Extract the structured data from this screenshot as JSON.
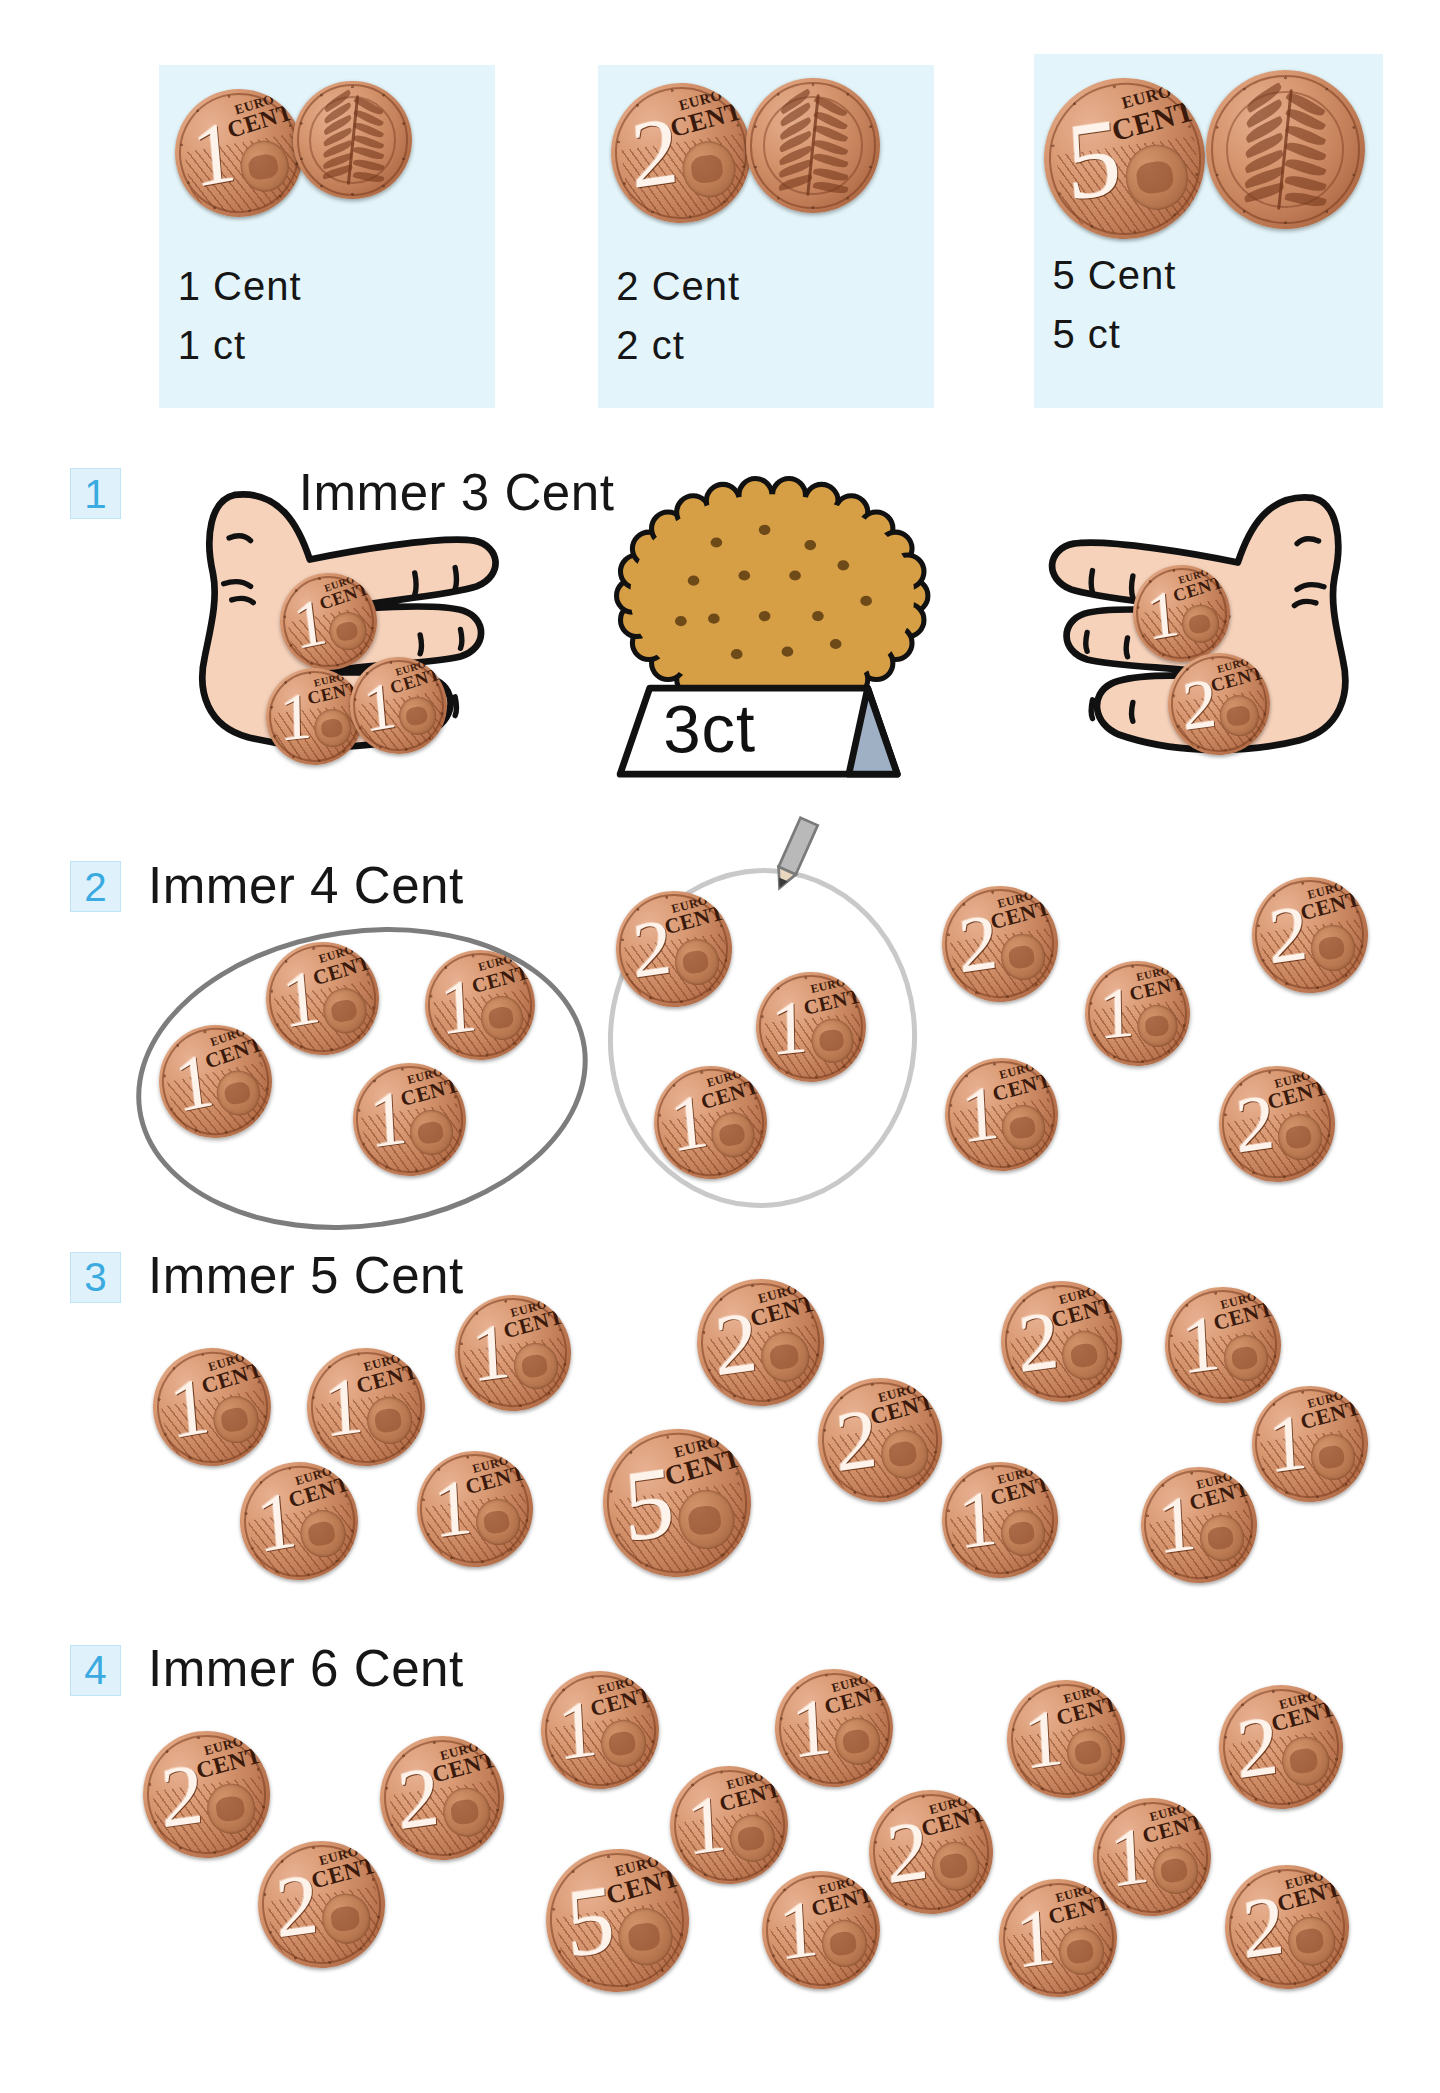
{
  "worksheet": {
    "language": "de",
    "background": "#ffffff",
    "panel_bg": "#e3f5fa",
    "badge_bg": "#dff2fb",
    "badge_border": "#bfe4f3",
    "badge_color": "#3aaae0",
    "text_color": "#161616",
    "coin_copper": "#c27e58",
    "hand_skin": "#f6d2bb",
    "biscuit_color": "#d79f45",
    "ellipse_dark": "#7d7d7d",
    "ellipse_light": "#c9c9c9"
  },
  "header": {
    "panels": [
      {
        "id": "panel-1-cent",
        "x": 118,
        "y": 48,
        "w": 250,
        "h": 255,
        "line1": "1 Cent",
        "line2": "1 ct",
        "value": 1,
        "coins": [
          {
            "value": 1,
            "side": "obverse",
            "x": 12,
            "y": 18,
            "size": 95,
            "rot": -10
          },
          {
            "value": 1,
            "side": "reverse",
            "x": 100,
            "y": 12,
            "size": 88,
            "rot": 0
          }
        ]
      },
      {
        "id": "panel-2-cent",
        "x": 444,
        "y": 48,
        "w": 250,
        "h": 255,
        "line1": "2 Cent",
        "line2": "2 ct",
        "value": 2,
        "coins": [
          {
            "value": 2,
            "side": "obverse",
            "x": 10,
            "y": 14,
            "size": 104,
            "rot": -8
          },
          {
            "value": 2,
            "side": "reverse",
            "x": 110,
            "y": 10,
            "size": 100,
            "rot": 0
          }
        ]
      },
      {
        "id": "panel-5-cent",
        "x": 768,
        "y": 40,
        "w": 260,
        "h": 263,
        "line1": "5 Cent",
        "line2": "5 ct",
        "value": 5,
        "coins": [
          {
            "value": 5,
            "side": "obverse",
            "x": 8,
            "y": 18,
            "size": 120,
            "rot": -8
          },
          {
            "value": 5,
            "side": "reverse",
            "x": 128,
            "y": 12,
            "size": 118,
            "rot": 0
          }
        ]
      }
    ]
  },
  "exercises": [
    {
      "number": "1",
      "title": "Immer 3 Cent",
      "badge": {
        "x": 52,
        "y": 348
      },
      "title_pos": {
        "x": 222,
        "y": 348
      },
      "price_sign": {
        "text": "3ct",
        "x": 455,
        "y": 505,
        "w": 215,
        "h": 75
      },
      "biscuit": {
        "x": 452,
        "y": 352,
        "w": 245,
        "h": 165
      },
      "hands": [
        {
          "id": "hand-left",
          "x": 112,
          "y": 348,
          "w": 320,
          "h": 235,
          "flip": false,
          "coins": [
            {
              "value": 1,
              "side": "obverse",
              "x": 96,
              "y": 78,
              "size": 72,
              "rot": -12
            },
            {
              "value": 1,
              "side": "obverse",
              "x": 86,
              "y": 148,
              "size": 72,
              "rot": -6
            },
            {
              "value": 1,
              "side": "obverse",
              "x": 148,
              "y": 140,
              "size": 72,
              "rot": -10
            }
          ]
        },
        {
          "id": "hand-right",
          "x": 718,
          "y": 350,
          "w": 320,
          "h": 235,
          "flip": true,
          "coins": [
            {
              "value": 1,
              "side": "obverse",
              "x": 124,
              "y": 70,
              "size": 72,
              "rot": -10
            },
            {
              "value": 2,
              "side": "obverse",
              "x": 150,
              "y": 135,
              "size": 76,
              "rot": -8
            }
          ]
        }
      ],
      "coins": []
    },
    {
      "number": "2",
      "title": "Immer 4 Cent",
      "badge": {
        "x": 52,
        "y": 640
      },
      "title_pos": {
        "x": 110,
        "y": 640
      },
      "groups": [
        {
          "id": "group-solved-dark",
          "x": 100,
          "y": 690,
          "w": 330,
          "h": 215,
          "color": "#7d7d7d",
          "width": 4,
          "rot": -8
        },
        {
          "id": "group-solved-light",
          "x": 452,
          "y": 645,
          "w": 222,
          "h": 245,
          "color": "#c9c9c9",
          "width": 4,
          "rot": 4
        }
      ],
      "pencil": {
        "x": 566,
        "y": 604,
        "w": 48,
        "h": 62
      },
      "coins": [
        {
          "value": 1,
          "side": "obverse",
          "x": 198,
          "y": 700,
          "size": 84,
          "rot": -10
        },
        {
          "value": 1,
          "side": "obverse",
          "x": 316,
          "y": 706,
          "size": 82,
          "rot": -8
        },
        {
          "value": 1,
          "side": "obverse",
          "x": 118,
          "y": 762,
          "size": 84,
          "rot": -12
        },
        {
          "value": 1,
          "side": "obverse",
          "x": 262,
          "y": 790,
          "size": 84,
          "rot": -8
        },
        {
          "value": 2,
          "side": "obverse",
          "x": 458,
          "y": 662,
          "size": 86,
          "rot": -8
        },
        {
          "value": 1,
          "side": "obverse",
          "x": 562,
          "y": 722,
          "size": 82,
          "rot": -6
        },
        {
          "value": 1,
          "side": "obverse",
          "x": 486,
          "y": 792,
          "size": 84,
          "rot": -10
        },
        {
          "value": 2,
          "side": "obverse",
          "x": 700,
          "y": 658,
          "size": 86,
          "rot": -8
        },
        {
          "value": 1,
          "side": "obverse",
          "x": 806,
          "y": 714,
          "size": 78,
          "rot": -6
        },
        {
          "value": 1,
          "side": "obverse",
          "x": 702,
          "y": 786,
          "size": 84,
          "rot": -8
        },
        {
          "value": 2,
          "side": "obverse",
          "x": 930,
          "y": 652,
          "size": 86,
          "rot": -8
        },
        {
          "value": 2,
          "side": "obverse",
          "x": 906,
          "y": 792,
          "size": 86,
          "rot": -8
        }
      ]
    },
    {
      "number": "3",
      "title": "Immer 5 Cent",
      "badge": {
        "x": 52,
        "y": 930
      },
      "title_pos": {
        "x": 110,
        "y": 930
      },
      "groups": [],
      "coins": [
        {
          "value": 1,
          "side": "obverse",
          "x": 114,
          "y": 1002,
          "size": 88,
          "rot": -10
        },
        {
          "value": 1,
          "side": "obverse",
          "x": 228,
          "y": 1002,
          "size": 88,
          "rot": -8
        },
        {
          "value": 1,
          "side": "obverse",
          "x": 338,
          "y": 962,
          "size": 86,
          "rot": -8
        },
        {
          "value": 1,
          "side": "obverse",
          "x": 178,
          "y": 1086,
          "size": 88,
          "rot": -10
        },
        {
          "value": 1,
          "side": "obverse",
          "x": 310,
          "y": 1078,
          "size": 86,
          "rot": -8
        },
        {
          "value": 5,
          "side": "obverse",
          "x": 448,
          "y": 1062,
          "size": 110,
          "rot": -8
        },
        {
          "value": 2,
          "side": "obverse",
          "x": 518,
          "y": 950,
          "size": 94,
          "rot": -8
        },
        {
          "value": 2,
          "side": "obverse",
          "x": 608,
          "y": 1024,
          "size": 92,
          "rot": -8
        },
        {
          "value": 2,
          "side": "obverse",
          "x": 744,
          "y": 952,
          "size": 90,
          "rot": -8
        },
        {
          "value": 1,
          "side": "obverse",
          "x": 866,
          "y": 956,
          "size": 86,
          "rot": -8
        },
        {
          "value": 1,
          "side": "obverse",
          "x": 700,
          "y": 1086,
          "size": 86,
          "rot": -8
        },
        {
          "value": 1,
          "side": "obverse",
          "x": 848,
          "y": 1090,
          "size": 86,
          "rot": -8
        },
        {
          "value": 1,
          "side": "obverse",
          "x": 930,
          "y": 1030,
          "size": 86,
          "rot": -8
        }
      ]
    },
    {
      "number": "4",
      "title": "Immer 6 Cent",
      "badge": {
        "x": 52,
        "y": 1222
      },
      "title_pos": {
        "x": 110,
        "y": 1222
      },
      "groups": [],
      "coins": [
        {
          "value": 2,
          "side": "obverse",
          "x": 106,
          "y": 1286,
          "size": 94,
          "rot": -8
        },
        {
          "value": 2,
          "side": "obverse",
          "x": 282,
          "y": 1290,
          "size": 92,
          "rot": -8
        },
        {
          "value": 2,
          "side": "obverse",
          "x": 192,
          "y": 1368,
          "size": 94,
          "rot": -8
        },
        {
          "value": 1,
          "side": "obverse",
          "x": 402,
          "y": 1242,
          "size": 88,
          "rot": -8
        },
        {
          "value": 1,
          "side": "obverse",
          "x": 498,
          "y": 1312,
          "size": 88,
          "rot": -8
        },
        {
          "value": 5,
          "side": "obverse",
          "x": 406,
          "y": 1374,
          "size": 106,
          "rot": -8
        },
        {
          "value": 1,
          "side": "obverse",
          "x": 576,
          "y": 1240,
          "size": 88,
          "rot": -8
        },
        {
          "value": 2,
          "side": "obverse",
          "x": 646,
          "y": 1330,
          "size": 92,
          "rot": -8
        },
        {
          "value": 1,
          "side": "obverse",
          "x": 566,
          "y": 1390,
          "size": 88,
          "rot": -8
        },
        {
          "value": 1,
          "side": "obverse",
          "x": 748,
          "y": 1248,
          "size": 88,
          "rot": -8
        },
        {
          "value": 1,
          "side": "obverse",
          "x": 812,
          "y": 1336,
          "size": 88,
          "rot": -8
        },
        {
          "value": 1,
          "side": "obverse",
          "x": 742,
          "y": 1396,
          "size": 88,
          "rot": -8
        },
        {
          "value": 2,
          "side": "obverse",
          "x": 906,
          "y": 1252,
          "size": 92,
          "rot": -8
        },
        {
          "value": 2,
          "side": "obverse",
          "x": 910,
          "y": 1386,
          "size": 92,
          "rot": -8
        }
      ]
    }
  ]
}
